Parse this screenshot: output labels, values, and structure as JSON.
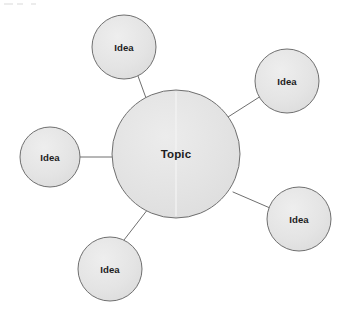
{
  "diagram": {
    "type": "radial-cluster-mind-map",
    "canvas": {
      "width": 347,
      "height": 320,
      "background": "#ffffff"
    },
    "style": {
      "node_fill": "#e2e2e2",
      "node_fill_light": "#ebebeb",
      "node_stroke": "#6f6f6f",
      "node_stroke_width": 1,
      "connector_stroke": "#6f6f6f",
      "connector_stroke_width": 1,
      "label_color": "#1d1d1d"
    },
    "center_node": {
      "id": "topic",
      "label": "Topic",
      "cx": 176,
      "cy": 154,
      "r": 64
    },
    "satellite_nodes": [
      {
        "id": "idea-top-left",
        "label": "Idea",
        "cx": 124,
        "cy": 47,
        "r": 32
      },
      {
        "id": "idea-top-right",
        "label": "Idea",
        "cx": 287,
        "cy": 81,
        "r": 32
      },
      {
        "id": "idea-left",
        "label": "Idea",
        "cx": 50,
        "cy": 157,
        "r": 30
      },
      {
        "id": "idea-bottom-right",
        "label": "Idea",
        "cx": 299,
        "cy": 219,
        "r": 32
      },
      {
        "id": "idea-bottom",
        "label": "Idea",
        "cx": 110,
        "cy": 269,
        "r": 32
      }
    ],
    "connectors": [
      {
        "id": "connector-topic-idea-top-left",
        "from": "topic",
        "to": "idea-top-left",
        "x1": 146,
        "y1": 98,
        "x2": 138,
        "y2": 76
      },
      {
        "id": "connector-topic-idea-top-right",
        "from": "topic",
        "to": "idea-top-right",
        "x1": 228,
        "y1": 117,
        "x2": 261,
        "y2": 96
      },
      {
        "id": "connector-topic-idea-left",
        "from": "topic",
        "to": "idea-left",
        "x1": 112,
        "y1": 157,
        "x2": 80,
        "y2": 157
      },
      {
        "id": "connector-topic-idea-bottom-right",
        "from": "topic",
        "to": "idea-bottom-right",
        "x1": 233,
        "y1": 192,
        "x2": 270,
        "y2": 208
      },
      {
        "id": "connector-topic-idea-bottom",
        "from": "topic",
        "to": "idea-bottom",
        "x1": 148,
        "y1": 209,
        "x2": 124,
        "y2": 240
      }
    ],
    "seam_artifact": {
      "x": 176,
      "y1": 92,
      "y2": 216,
      "color": "#f2f2f2"
    },
    "scan_specks": [
      {
        "x": 4,
        "y": 3,
        "w": 9,
        "h": 2
      },
      {
        "x": 17,
        "y": 3,
        "w": 6,
        "h": 2
      },
      {
        "x": 31,
        "y": 3,
        "w": 5,
        "h": 2
      }
    ]
  }
}
